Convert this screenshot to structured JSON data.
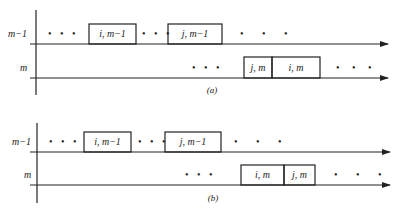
{
  "diagram": {
    "panels": [
      {
        "caption": "(a)",
        "rows": [
          {
            "label": "m−1"
          },
          {
            "label": "m"
          }
        ],
        "boxes": {
          "row1": [
            {
              "label": "i, m−1"
            },
            {
              "label": "j, m−1"
            }
          ],
          "row2": [
            {
              "label": "j, m"
            },
            {
              "label": "i, m"
            }
          ]
        },
        "ellipsis": "• • •"
      },
      {
        "caption": "(b)",
        "rows": [
          {
            "label": "m−1"
          },
          {
            "label": "m"
          }
        ],
        "boxes": {
          "row1": [
            {
              "label": "i, m−1"
            },
            {
              "label": "j, m−1"
            }
          ],
          "row2": [
            {
              "label": "i, m"
            },
            {
              "label": "j, m"
            }
          ]
        },
        "ellipsis": "• • •"
      }
    ]
  }
}
